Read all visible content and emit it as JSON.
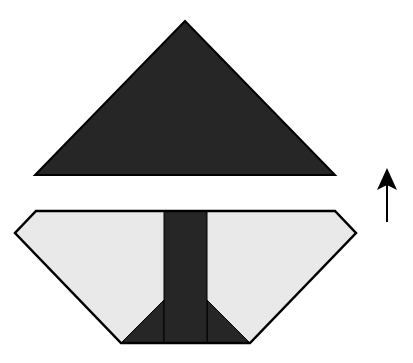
{
  "diagram": {
    "type": "origami-fold-step",
    "colors": {
      "dark_fill": "#262626",
      "light_fill": "#e9e9e9",
      "stroke": "#000000",
      "background": "#ffffff"
    },
    "top_shape": {
      "kind": "triangle",
      "points": "185,21 335,175 35,175"
    },
    "bottom_shape": {
      "kind": "hexagon",
      "outline": "36,211 335,211 356,233 250,343 121,343 15,233",
      "center_strip": "164,211 207,211 207,343 164,343",
      "left_flap": "164,300 164,343 121,343",
      "right_flap": "207,300 250,343 207,343"
    },
    "arrow": {
      "direction": "up",
      "tip": [
        387,
        168
      ],
      "tail": [
        387,
        222
      ]
    }
  }
}
